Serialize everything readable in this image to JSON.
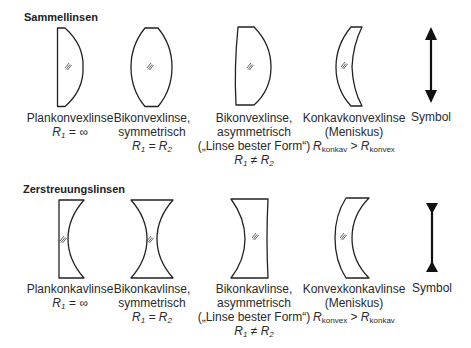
{
  "sections": [
    {
      "title": "Sammellinsen",
      "lenses": [
        {
          "name": "Plankonvexlinse",
          "lines": [],
          "formula": {
            "lhs": "R",
            "lhs_sub": "1",
            "op": "=",
            "rhs": "∞",
            "rhs_sub": ""
          }
        },
        {
          "name": "Bikonvexlinse,",
          "lines": [
            "symmetrisch"
          ],
          "formula": {
            "lhs": "R",
            "lhs_sub": "1",
            "op": "=",
            "rhs": "R",
            "rhs_sub": "2"
          }
        },
        {
          "name": "Bikonvexlinse,",
          "lines": [
            "asymmetrisch",
            "(„Linse bester Form“)"
          ],
          "formula": {
            "lhs": "R",
            "lhs_sub": "1",
            "op": "≠",
            "rhs": "R",
            "rhs_sub": "2"
          }
        },
        {
          "name": "Konkavkonvexlinse",
          "lines": [
            "(Meniskus)"
          ],
          "formula": {
            "lhs": "R",
            "lhs_sub": "konkav",
            "op": ">",
            "rhs": "R",
            "rhs_sub": "konvex"
          }
        },
        {
          "name": "Symbol",
          "lines": [],
          "formula": null
        }
      ]
    },
    {
      "title": "Zerstreuungslinsen",
      "lenses": [
        {
          "name": "Plankonkavlinse",
          "lines": [],
          "formula": {
            "lhs": "R",
            "lhs_sub": "1",
            "op": "=",
            "rhs": "∞",
            "rhs_sub": ""
          }
        },
        {
          "name": "Bikonkavlinse,",
          "lines": [
            "symmetrisch"
          ],
          "formula": {
            "lhs": "R",
            "lhs_sub": "1",
            "op": "=",
            "rhs": "R",
            "rhs_sub": "2"
          }
        },
        {
          "name": "Bikonkavlinse,",
          "lines": [
            "asymmetrisch",
            "(„Linse bester Form“)"
          ],
          "formula": {
            "lhs": "R",
            "lhs_sub": "1",
            "op": "≠",
            "rhs": "R",
            "rhs_sub": "2"
          }
        },
        {
          "name": "Konvexkonkavlinse",
          "lines": [
            "(Meniskus)"
          ],
          "formula": {
            "lhs": "R",
            "lhs_sub": "konvex",
            "op": ">",
            "rhs": "R",
            "rhs_sub": "konkav"
          }
        },
        {
          "name": "Symbol",
          "lines": [],
          "formula": null
        }
      ]
    }
  ],
  "colors": {
    "stroke": "#222222",
    "hatch": "#555555",
    "text": "#2a2a2a"
  }
}
